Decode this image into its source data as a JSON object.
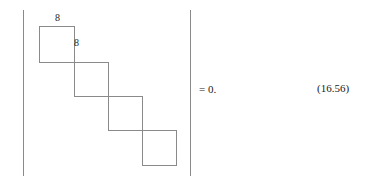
{
  "figure": {
    "kind": "determinant-equation",
    "background_color": "#ffffff",
    "line_color": "#8a8a8a",
    "text_color": "#1a1a1a"
  },
  "determinant": {
    "left_bar_glyph": "|",
    "right_bar_glyph": "|",
    "bar_top": 10,
    "bar_height": 166,
    "left_bar_x": 23,
    "right_bar_x": 190
  },
  "matrix_band": {
    "description": "staircase of overlapping squares along the main diagonal",
    "square_count": 5,
    "square_size": 35,
    "step_x": 34,
    "step_y": 34,
    "origin_x": 39,
    "origin_y": 26,
    "squares": [
      {
        "index": 0,
        "x": 39,
        "y": 26,
        "w": 36,
        "h": 37
      },
      {
        "index": 1,
        "x": 74,
        "y": 62,
        "w": 35,
        "h": 35
      },
      {
        "index": 2,
        "x": 108,
        "y": 96,
        "w": 35,
        "h": 35
      },
      {
        "index": 3,
        "x": 142,
        "y": 130,
        "w": 35,
        "h": 36
      },
      {
        "index": 4,
        "x": 107,
        "y": 96,
        "w": 0,
        "h": 0
      }
    ],
    "entry_labels": [
      {
        "index": 0,
        "text": "8",
        "anchor": "top-edge-of-first-square"
      },
      {
        "index": 1,
        "text": "8",
        "anchor": "right-of-first-square"
      }
    ]
  },
  "rhs": {
    "text": "= 0."
  },
  "equation": {
    "number": "(16.56)"
  }
}
